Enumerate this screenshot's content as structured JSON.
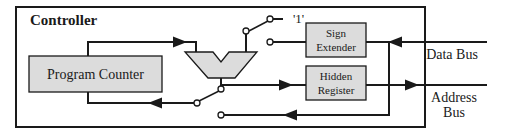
{
  "diagram": {
    "title": "Controller",
    "blocks": {
      "program_counter": "Program Counter",
      "sign_extender_line1": "Sign",
      "sign_extender_line2": "Extender",
      "hidden_register_line1": "Hidden",
      "hidden_register_line2": "Register"
    },
    "constant_label": "'1'",
    "external": {
      "data_bus": "Data Bus",
      "address_bus_line1": "Address",
      "address_bus_line2": "Bus"
    },
    "colors": {
      "line": "#1a1a1a",
      "block_fill": "#dcdcdc",
      "background": "#ffffff"
    }
  }
}
